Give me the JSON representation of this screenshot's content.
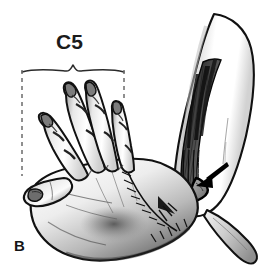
{
  "figure": {
    "type": "anatomical-illustration",
    "panel_label": "B",
    "background_color": "#ffffff",
    "ink_color": "#111111",
    "mid_tone": "#9a9a9a",
    "light_tone": "#e2e2e2",
    "dark_tone": "#2f2f2f"
  },
  "annotations": {
    "bracket": {
      "label": "C5",
      "label_color": "#1b1b1b",
      "span_left_x": 22,
      "span_right_x": 124,
      "brace_y": 70,
      "dashed_left": {
        "x": 22,
        "y_top": 68,
        "y_bottom": 176
      },
      "dashed_right": {
        "x": 124,
        "y_top": 68,
        "y_bottom": 101
      },
      "dash_color": "#6b6b6b"
    },
    "arrow": {
      "name": "pointer-arrow",
      "description": "Solid black arrow pointing down-left at the triangular tendon wedge on the forearm",
      "tip_x": 196,
      "tip_y": 186,
      "tail_x": 228,
      "tail_y": 163,
      "color": "#000000"
    },
    "wedge": {
      "name": "tendon-wedge",
      "description": "Triangular tendon/muscle insertion highlighted by the arrow",
      "fill": "#8d8d8d",
      "stroke": "#000000"
    }
  },
  "structures": [
    {
      "name": "thumb",
      "label": "Thumb, abducted toward lower left"
    },
    {
      "name": "index-finger",
      "label": "Index finger, extended"
    },
    {
      "name": "middle-finger",
      "label": "Middle finger, extended"
    },
    {
      "name": "ring-finger",
      "label": "Ring finger, extended"
    },
    {
      "name": "little-finger",
      "label": "Little finger, extended"
    },
    {
      "name": "palm",
      "label": "Palm with shaded hollow"
    },
    {
      "name": "wrist-suture-line",
      "label": "Suture line across the wrist"
    },
    {
      "name": "forearm",
      "label": "Forearm, light-shaded"
    },
    {
      "name": "forearm-muscle-belly",
      "label": "Dark striated muscle belly along the ulnar border of the forearm"
    },
    {
      "name": "tendon-graft-strip",
      "label": "Narrow elongated tendon strip extending distally below the elbow"
    }
  ]
}
